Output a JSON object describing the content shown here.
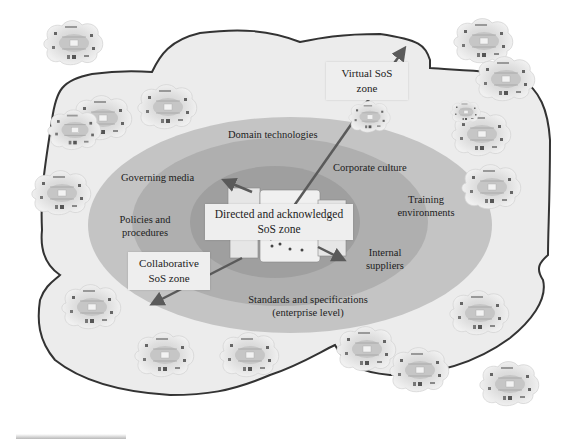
{
  "figure": {
    "type": "nested zone diagram",
    "colors": {
      "outer_cloud_fill": "#ececec",
      "outer_cloud_stroke": "#333333",
      "enterprise_ellipse": "#bdbdbd",
      "middle_ellipse": "#a9a9a9",
      "inner_ellipse": "#9a9a9a",
      "arrow": "#5a5a5a",
      "label_box": "#eeeeee"
    },
    "zones": {
      "virtual": {
        "line1": "Virtual SoS",
        "line2": "zone"
      },
      "directed": {
        "line1": "Directed and acknowledged",
        "line2": "SoS zone"
      },
      "collaborative": {
        "line1": "Collaborative",
        "line2": "SoS zone"
      }
    },
    "ring_labels": {
      "domain_technologies": "Domain technologies",
      "corporate_culture": "Corporate culture",
      "governing_media": "Governing media",
      "training_line1": "Training",
      "training_line2": "environments",
      "policies_line1": "Policies and",
      "policies_line2": "procedures",
      "internal_line1": "Internal",
      "internal_line2": "suppliers",
      "standards_line1": "Standards and specifications",
      "standards_line2": "(enterprise level)"
    },
    "central_panel": {
      "header": "Directed SoS"
    },
    "mini_diagram_icon": "sos-network-cloud-icon",
    "arrows": [
      "arrow-to-virtual-zone",
      "arrow-to-collaborative-zone",
      "arrow-upper-left",
      "arrow-lower-right"
    ]
  }
}
